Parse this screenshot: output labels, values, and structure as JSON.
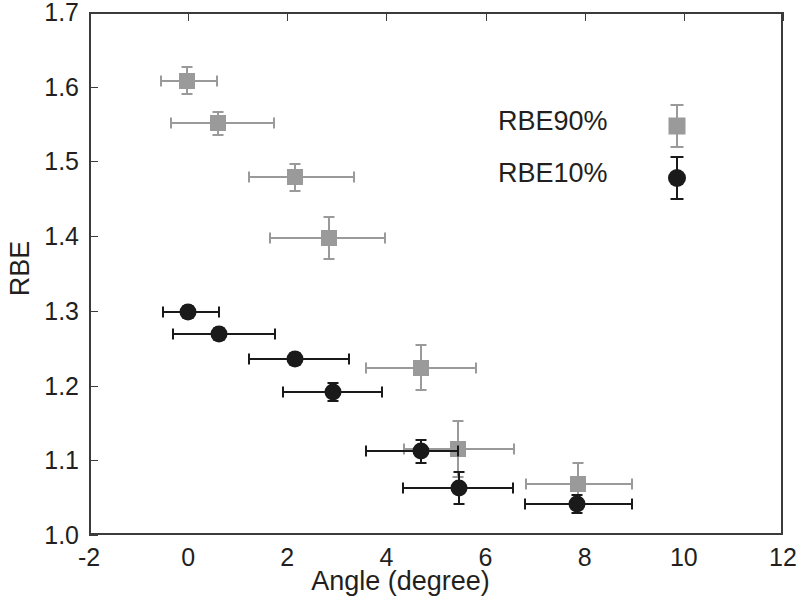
{
  "chart_data": {
    "type": "scatter",
    "title": "",
    "xlabel": "Angle (degree)",
    "ylabel": "RBE",
    "xlim": [
      -2,
      12
    ],
    "ylim": [
      1.0,
      1.7
    ],
    "xticks": [
      -2,
      0,
      2,
      4,
      6,
      8,
      10,
      12
    ],
    "xticklabels": [
      "-2",
      "0",
      "2",
      "4",
      "6",
      "8",
      "10",
      "12"
    ],
    "yticks": [
      1.0,
      1.1,
      1.2,
      1.3,
      1.4,
      1.5,
      1.6,
      1.7
    ],
    "yticklabels": [
      "1.0",
      "1.1",
      "1.2",
      "1.3",
      "1.4",
      "1.5",
      "1.6",
      "1.7"
    ],
    "grid": false,
    "legend_position": "upper right",
    "series": [
      {
        "name": "RBE90%",
        "marker": "square",
        "color": "#9a9a9a",
        "points": [
          {
            "x": -0.02,
            "y": 1.608,
            "xerr_low": 0.52,
            "xerr_high": 0.6,
            "yerr": 0.018
          },
          {
            "x": 0.6,
            "y": 1.551,
            "xerr_low": 0.95,
            "xerr_high": 1.13,
            "yerr": 0.015
          },
          {
            "x": 2.15,
            "y": 1.479,
            "xerr_low": 0.92,
            "xerr_high": 1.2,
            "yerr": 0.018
          },
          {
            "x": 2.85,
            "y": 1.398,
            "xerr_low": 1.2,
            "xerr_high": 1.13,
            "yerr": 0.028
          },
          {
            "x": 4.7,
            "y": 1.224,
            "xerr_low": 1.12,
            "xerr_high": 1.1,
            "yerr": 0.03
          },
          {
            "x": 5.45,
            "y": 1.115,
            "xerr_low": 1.1,
            "xerr_high": 1.13,
            "yerr": 0.038
          },
          {
            "x": 7.87,
            "y": 1.068,
            "xerr_low": 1.05,
            "xerr_high": 1.08,
            "yerr": 0.028
          }
        ]
      },
      {
        "name": "RBE10%",
        "marker": "circle",
        "color": "#1a1a1a",
        "points": [
          {
            "x": 0.0,
            "y": 1.299,
            "xerr_low": 0.5,
            "xerr_high": 0.62,
            "yerr": 0.008
          },
          {
            "x": 0.62,
            "y": 1.269,
            "xerr_low": 0.92,
            "xerr_high": 1.13,
            "yerr": 0.008
          },
          {
            "x": 2.15,
            "y": 1.236,
            "xerr_low": 0.92,
            "xerr_high": 1.1,
            "yerr": 0.008
          },
          {
            "x": 2.92,
            "y": 1.192,
            "xerr_low": 1.0,
            "xerr_high": 1.0,
            "yerr": 0.012
          },
          {
            "x": 4.7,
            "y": 1.112,
            "xerr_low": 1.12,
            "xerr_high": 0.75,
            "yerr": 0.015
          },
          {
            "x": 5.47,
            "y": 1.063,
            "xerr_low": 1.13,
            "xerr_high": 1.08,
            "yerr": 0.022
          },
          {
            "x": 7.85,
            "y": 1.041,
            "xerr_low": 1.05,
            "xerr_high": 1.1,
            "yerr": 0.012
          }
        ]
      }
    ]
  },
  "legend": {
    "entries": [
      {
        "label": "RBE90%",
        "marker": "square",
        "color": "#9a9a9a"
      },
      {
        "label": "RBE10%",
        "marker": "circle",
        "color": "#1a1a1a"
      }
    ]
  },
  "style": {
    "axis_color": "#3b3b3b",
    "text_color": "#231f20",
    "background": "#ffffff"
  }
}
